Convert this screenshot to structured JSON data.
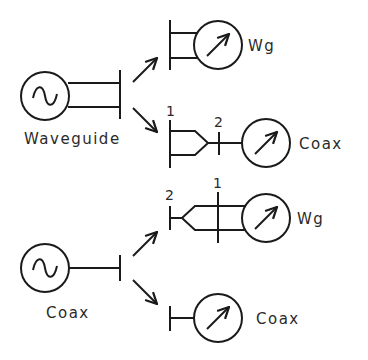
{
  "diagram": {
    "type": "measurement-setup-schematic",
    "colors": {
      "line": "#1a1a1a",
      "text": "#2a2a2a",
      "background": "#ffffff"
    },
    "top_group": {
      "source": {
        "icon": "ac-source-icon",
        "label": "Waveguide"
      },
      "branch_a": {
        "detector_label": "Wg"
      },
      "branch_b": {
        "port_1": "1",
        "port_2": "2",
        "detector_label": "Coax",
        "adapter": "waveguide-to-coax"
      }
    },
    "bottom_group": {
      "source": {
        "icon": "ac-source-icon",
        "label": "Coax"
      },
      "branch_a": {
        "port_1": "1",
        "port_2": "2",
        "detector_label": "Wg",
        "adapter": "coax-to-waveguide"
      },
      "branch_b": {
        "detector_label": "Coax"
      }
    }
  }
}
